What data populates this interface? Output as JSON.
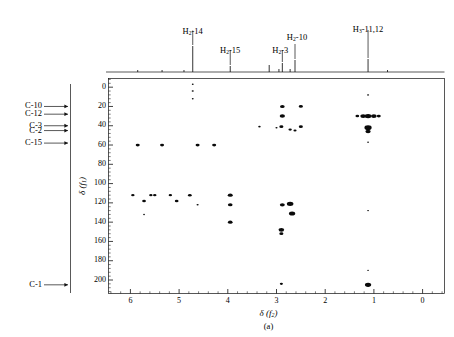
{
  "figure": {
    "panel_letter": "(a)",
    "type": "2D NMR HMBC/HSQC correlation spectrum"
  },
  "axes": {
    "x": {
      "title_delta": "δ",
      "title_dim": "f",
      "title_sub": "2",
      "ticks": [
        "6",
        "5",
        "4",
        "3",
        "2",
        "1",
        "0"
      ],
      "tick_values": [
        6,
        5,
        4,
        3,
        2,
        1,
        0
      ],
      "range": [
        6.45,
        -0.45
      ],
      "minor_per_major": 5
    },
    "y": {
      "title_delta": "δ",
      "title_dim": "f",
      "title_sub": "1",
      "ticks": [
        "0",
        "20",
        "40",
        "60",
        "80",
        "100",
        "120",
        "140",
        "160",
        "180",
        "200"
      ],
      "tick_values": [
        0,
        20,
        40,
        60,
        80,
        100,
        120,
        140,
        160,
        180,
        200
      ],
      "range": [
        -9,
        214
      ],
      "minor_per_major": 4
    }
  },
  "proton_labels": [
    {
      "text": "H₂-14",
      "html": "H<sub>2</sub>-14",
      "ppm": 4.72
    },
    {
      "text": "H₂-15",
      "html": "H<sub>2</sub>-15",
      "ppm": 3.95
    },
    {
      "text": "H₂-3",
      "html": "H<sub>2</sub>-3",
      "ppm": 2.88
    },
    {
      "text": "H₂-10",
      "html": "H<sub>2</sub>-10",
      "ppm": 2.62
    },
    {
      "text": "H₃-11,12",
      "html": "H<sub>3</sub>-11,12",
      "ppm": 1.12
    }
  ],
  "carbon_labels": [
    {
      "text": "C-10",
      "ppm": 20
    },
    {
      "text": "C-12",
      "ppm": 28
    },
    {
      "text": "C-3",
      "ppm": 40
    },
    {
      "text": "C-2",
      "ppm": 45
    },
    {
      "text": "C-15",
      "ppm": 58
    },
    {
      "text": "C-1",
      "ppm": 205
    }
  ],
  "chart_data": {
    "type": "scatter",
    "title": "",
    "xlabel": "δ (f2)",
    "ylabel": "δ (f1)",
    "xlim": [
      6.45,
      -0.45
    ],
    "ylim": [
      214,
      -9
    ],
    "grid": false,
    "legend": "none",
    "trace_1d": {
      "description": "1D proton projection along top",
      "peaks_ppm": [
        5.85,
        5.35,
        4.9,
        4.72,
        3.95,
        3.15,
        2.95,
        2.88,
        2.72,
        2.62,
        1.12,
        0.72
      ],
      "peak_heights": [
        2,
        2,
        2,
        26,
        6,
        7,
        3,
        9,
        3,
        12,
        13,
        2
      ]
    },
    "cross_peaks": [
      {
        "x": 4.72,
        "y": -3,
        "size": 1.2
      },
      {
        "x": 4.72,
        "y": 4,
        "size": 1.4
      },
      {
        "x": 4.72,
        "y": 12,
        "size": 1.2
      },
      {
        "x": 1.12,
        "y": 8,
        "size": 1.4
      },
      {
        "x": 2.88,
        "y": 20,
        "size": 3.0
      },
      {
        "x": 2.5,
        "y": 20,
        "size": 2.6
      },
      {
        "x": 2.88,
        "y": 30,
        "size": 3.4
      },
      {
        "x": 1.22,
        "y": 30,
        "size": 3.6
      },
      {
        "x": 1.12,
        "y": 30,
        "size": 4.2
      },
      {
        "x": 1.0,
        "y": 30,
        "size": 3.6
      },
      {
        "x": 0.9,
        "y": 30,
        "size": 2.6
      },
      {
        "x": 1.34,
        "y": 30,
        "size": 2.4
      },
      {
        "x": 1.12,
        "y": 42,
        "size": 4.6
      },
      {
        "x": 1.12,
        "y": 46,
        "size": 3.4
      },
      {
        "x": 3.35,
        "y": 41,
        "size": 1.6
      },
      {
        "x": 3.0,
        "y": 42,
        "size": 1.4
      },
      {
        "x": 2.9,
        "y": 41,
        "size": 2.6
      },
      {
        "x": 2.72,
        "y": 44,
        "size": 2.2
      },
      {
        "x": 2.62,
        "y": 45,
        "size": 2.0
      },
      {
        "x": 2.5,
        "y": 41,
        "size": 2.6
      },
      {
        "x": 5.85,
        "y": 60,
        "size": 2.6
      },
      {
        "x": 5.35,
        "y": 60,
        "size": 2.6
      },
      {
        "x": 4.62,
        "y": 60,
        "size": 2.6
      },
      {
        "x": 4.28,
        "y": 60,
        "size": 2.6
      },
      {
        "x": 1.12,
        "y": 57,
        "size": 1.2
      },
      {
        "x": 5.95,
        "y": 112,
        "size": 2.2
      },
      {
        "x": 5.58,
        "y": 112,
        "size": 2.2
      },
      {
        "x": 5.5,
        "y": 112,
        "size": 2.2
      },
      {
        "x": 5.18,
        "y": 112,
        "size": 2.2
      },
      {
        "x": 4.78,
        "y": 112,
        "size": 2.4
      },
      {
        "x": 5.72,
        "y": 118,
        "size": 2.4
      },
      {
        "x": 5.05,
        "y": 118,
        "size": 2.4
      },
      {
        "x": 4.62,
        "y": 122,
        "size": 1.4
      },
      {
        "x": 5.72,
        "y": 132,
        "size": 1.1
      },
      {
        "x": 3.95,
        "y": 112,
        "size": 3.2
      },
      {
        "x": 3.95,
        "y": 122,
        "size": 3.0
      },
      {
        "x": 3.95,
        "y": 140,
        "size": 3.0
      },
      {
        "x": 2.88,
        "y": 122,
        "size": 3.2
      },
      {
        "x": 2.72,
        "y": 121,
        "size": 4.2
      },
      {
        "x": 2.68,
        "y": 131,
        "size": 4.0
      },
      {
        "x": 2.9,
        "y": 148,
        "size": 3.6
      },
      {
        "x": 2.9,
        "y": 152,
        "size": 2.6
      },
      {
        "x": 1.12,
        "y": 128,
        "size": 1.2
      },
      {
        "x": 2.9,
        "y": 204,
        "size": 2.0
      },
      {
        "x": 1.12,
        "y": 205,
        "size": 4.0
      },
      {
        "x": 1.12,
        "y": 190,
        "size": 1.0
      }
    ]
  }
}
